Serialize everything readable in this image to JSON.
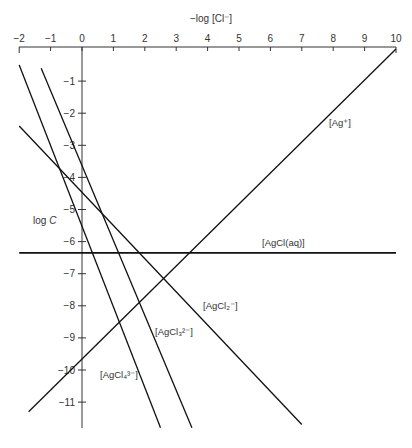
{
  "chart_data": {
    "type": "line",
    "title": "",
    "xlabel": "−log [Cl⁻]",
    "ylabel": "log C",
    "xlim": [
      -2,
      10
    ],
    "ylim": [
      -12,
      0
    ],
    "x_ticks": [
      "−2",
      "−1",
      "0",
      "1",
      "2",
      "3",
      "4",
      "5",
      "6",
      "7",
      "8",
      "9",
      "10"
    ],
    "y_ticks": [
      "−1",
      "−2",
      "−3",
      "−4",
      "−5",
      "−6",
      "−7",
      "−8",
      "−9",
      "−10",
      "−11"
    ],
    "series": [
      {
        "name": "[Ag⁺]",
        "label": "[Ag⁺]",
        "points": [
          [
            -1.7,
            -11.3
          ],
          [
            10,
            0
          ]
        ],
        "slope": 1
      },
      {
        "name": "[AgCl(aq)]",
        "label": "[AgCl(aq)]",
        "points": [
          [
            -2,
            -6.35
          ],
          [
            10,
            -6.35
          ]
        ],
        "slope": 0
      },
      {
        "name": "[AgCl₂⁻]",
        "label": "[AgCl₂⁻]",
        "points": [
          [
            -2,
            -2.4
          ],
          [
            7,
            -11.7
          ]
        ],
        "slope": -1
      },
      {
        "name": "[AgCl₃²⁻]",
        "label": "[AgCl₃²⁻]",
        "points": [
          [
            -1.3,
            -0.6
          ],
          [
            3.5,
            -11.8
          ]
        ],
        "slope": -2
      },
      {
        "name": "[AgCl₄³⁻]",
        "label": "[AgCl₄³⁻]",
        "points": [
          [
            -2,
            -0.5
          ],
          [
            2.5,
            -11.8
          ]
        ],
        "slope": -3
      }
    ],
    "grid": false,
    "legend": "inline labels"
  },
  "labels": {
    "x_axis_title": "−log [Cl⁻]",
    "y_axis_title": "log C",
    "ag": "[Ag⁺]",
    "agcl_aq": "[AgCl(aq)]",
    "agcl2": "[AgCl₂⁻]",
    "agcl3": "[AgCl₃²⁻]",
    "agcl4": "[AgCl₄³⁻]"
  }
}
